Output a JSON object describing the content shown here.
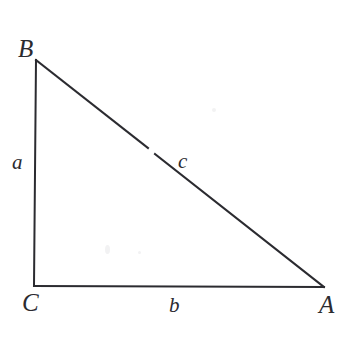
{
  "figure": {
    "kind": "right-triangle-diagram",
    "width": 356,
    "height": 343,
    "background_color": "#ffffff",
    "stroke_color": "#2b2b30",
    "stroke_width": 2
  },
  "vertices": [
    {
      "key": "B",
      "label": "B",
      "x": 36,
      "y": 60,
      "label_x": 18,
      "label_y": 36
    },
    {
      "key": "C",
      "label": "C",
      "x": 34,
      "y": 286,
      "label_x": 22,
      "label_y": 290
    },
    {
      "key": "A",
      "label": "A",
      "x": 324,
      "y": 287,
      "label_x": 319,
      "label_y": 292
    }
  ],
  "sides": [
    {
      "key": "a",
      "label": "a",
      "from": "B",
      "to": "C",
      "label_x": 12,
      "label_y": 152
    },
    {
      "key": "b",
      "label": "b",
      "from": "C",
      "to": "A",
      "label_x": 169,
      "label_y": 295
    },
    {
      "key": "c",
      "label": "c",
      "from": "B",
      "to": "A",
      "label_x": 178,
      "label_y": 151
    }
  ]
}
